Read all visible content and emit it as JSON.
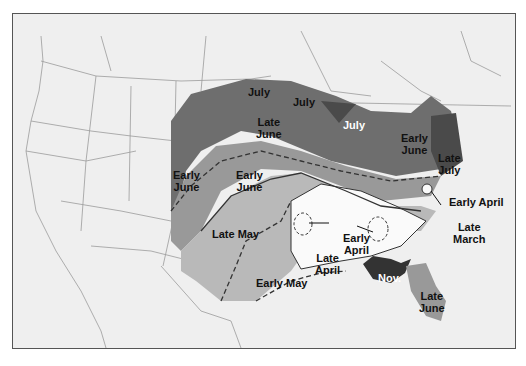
{
  "map": {
    "subject": "Regional timing map of the contiguous United States",
    "colors": {
      "background": "#efefef",
      "border_lines": "#9a9a9a",
      "darkest_zone": "#4a4a4a",
      "dark_zone": "#6e6e6e",
      "mid_zone": "#999999",
      "light_zone": "#b9b9b9",
      "lightest_zone": "#d2d2d2",
      "white_zone": "#fafafa"
    },
    "labels": {
      "july_northwest": "July",
      "july_north_central": "July",
      "july_michigan": "July",
      "late_june_north": "Late\nJune",
      "early_june_west": "Early\nJune",
      "early_june_central": "Early\nJune",
      "early_june_northeast": "Early\nJune",
      "late_july": "Late\nJuly",
      "early_april_east": "Early April",
      "late_march": "Late\nMarch",
      "late_may": "Late May",
      "early_april_south": "Early\nApril",
      "late_april": "Late\nApril",
      "early_may": "Early May",
      "nov": "Nov.",
      "late_june_florida": "Late\nJune"
    }
  }
}
